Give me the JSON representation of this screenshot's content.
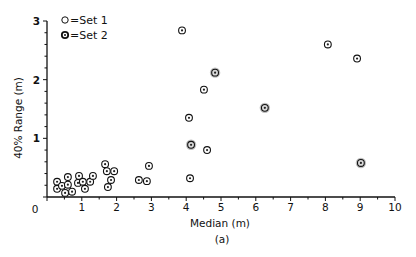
{
  "chart_data": {
    "type": "scatter",
    "title": "",
    "caption": "(a)",
    "xlabel": "Median (m)",
    "ylabel": "40% Range (m)",
    "xlim": [
      0,
      10
    ],
    "ylim": [
      0,
      3
    ],
    "x_ticks": [
      "0",
      "1",
      "2",
      "3",
      "4",
      "5",
      "6",
      "7",
      "8",
      "9",
      "10"
    ],
    "y_ticks": [
      "1",
      "2",
      "3"
    ],
    "grid": false,
    "legend": {
      "position": "upper-left",
      "entries": [
        {
          "symbol": "○",
          "label": "=Set 1"
        },
        {
          "symbol": "⊙",
          "label": "=Set 2"
        }
      ]
    },
    "series": [
      {
        "name": "Set 1 / Set 2 (combined, labelled circles)",
        "points": [
          {
            "x": 0.29,
            "y": 0.26
          },
          {
            "x": 0.29,
            "y": 0.14
          },
          {
            "x": 0.43,
            "y": 0.19
          },
          {
            "x": 0.6,
            "y": 0.34
          },
          {
            "x": 0.6,
            "y": 0.21
          },
          {
            "x": 0.52,
            "y": 0.07
          },
          {
            "x": 0.72,
            "y": 0.09
          },
          {
            "x": 0.92,
            "y": 0.36
          },
          {
            "x": 0.89,
            "y": 0.24
          },
          {
            "x": 1.03,
            "y": 0.26
          },
          {
            "x": 1.09,
            "y": 0.14
          },
          {
            "x": 1.24,
            "y": 0.26
          },
          {
            "x": 1.32,
            "y": 0.36
          },
          {
            "x": 1.67,
            "y": 0.56
          },
          {
            "x": 1.72,
            "y": 0.44
          },
          {
            "x": 1.93,
            "y": 0.44
          },
          {
            "x": 1.84,
            "y": 0.29
          },
          {
            "x": 1.75,
            "y": 0.17
          },
          {
            "x": 2.64,
            "y": 0.29
          },
          {
            "x": 2.87,
            "y": 0.27
          },
          {
            "x": 2.93,
            "y": 0.53
          },
          {
            "x": 3.88,
            "y": 2.84
          },
          {
            "x": 4.11,
            "y": 0.32
          },
          {
            "x": 4.08,
            "y": 1.35
          },
          {
            "x": 4.14,
            "y": 0.89,
            "shade": true
          },
          {
            "x": 4.6,
            "y": 0.8
          },
          {
            "x": 4.51,
            "y": 1.83
          },
          {
            "x": 4.83,
            "y": 2.12,
            "shade": true
          },
          {
            "x": 6.26,
            "y": 1.52,
            "shade": true
          },
          {
            "x": 8.07,
            "y": 2.6
          },
          {
            "x": 8.91,
            "y": 2.36
          },
          {
            "x": 9.02,
            "y": 0.58,
            "shade": true
          }
        ]
      }
    ]
  }
}
